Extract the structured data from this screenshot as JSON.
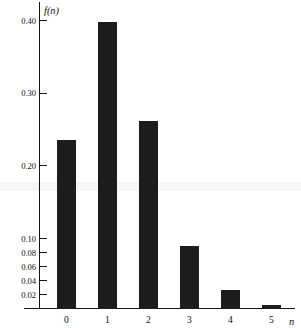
{
  "chart_data": {
    "type": "bar",
    "title": "",
    "subtitle": "",
    "xlabel": "n",
    "ylabel": "f(n)",
    "categories": [
      "0",
      "1",
      "2",
      "3",
      "4",
      "5"
    ],
    "values": [
      0.235,
      0.398,
      0.262,
      0.09,
      0.026,
      0.005
    ],
    "x": [
      0,
      1,
      2,
      3,
      4,
      5
    ],
    "ylim": [
      0,
      0.42
    ],
    "xlim": [
      -0.6,
      6.2
    ],
    "grid": false,
    "legend": null,
    "legend_position": "none",
    "bar_color": "#1c1c1c",
    "axis_color": "#141414",
    "y_axis_scale": "piecewise-compressed",
    "y_ticks": [
      {
        "label": "0.40",
        "value": 0.4
      },
      {
        "label": "0.30",
        "value": 0.3
      },
      {
        "label": "0.20",
        "value": 0.2
      },
      {
        "label": "0.10",
        "value": 0.1
      },
      {
        "label": "0.08",
        "value": 0.08
      },
      {
        "label": "0.06",
        "value": 0.06
      },
      {
        "label": "0.04",
        "value": 0.04
      },
      {
        "label": "0.02",
        "value": 0.02
      }
    ],
    "x_ticks": [
      {
        "label": "0",
        "value": 0
      },
      {
        "label": "1",
        "value": 1
      },
      {
        "label": "2",
        "value": 2
      },
      {
        "label": "3",
        "value": 3
      },
      {
        "label": "4",
        "value": 4
      },
      {
        "label": "5",
        "value": 5
      }
    ],
    "annotations": []
  },
  "axes": {
    "y_axis_title": "f(n)",
    "x_axis_title": "n"
  },
  "ytick_labels": {
    "t0": "0.40",
    "t1": "0.30",
    "t2": "0.20",
    "t3": "0.10",
    "t4": "0.08",
    "t5": "0.06",
    "t6": "0.04",
    "t7": "0.02"
  },
  "xtick_labels": {
    "t0": "0",
    "t1": "1",
    "t2": "2",
    "t3": "3",
    "t4": "4",
    "t5": "5"
  }
}
